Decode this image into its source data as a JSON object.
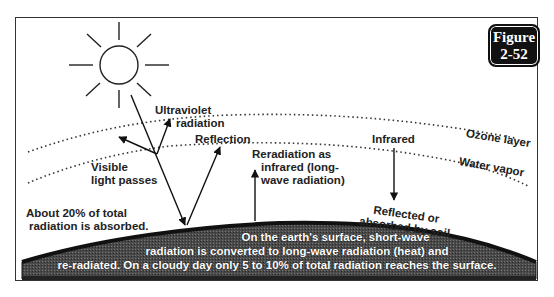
{
  "figure": {
    "badge_line1": "Figure",
    "badge_line2": "2-52"
  },
  "labels": {
    "ultraviolet_line1": "Ultraviolet",
    "ultraviolet_line2": "radiation",
    "reflection": "Reflection",
    "visible_line1": "Visible",
    "visible_line2": "light passes",
    "reradiation_line1": "Reradiation as",
    "reradiation_line2": "infrared (long-",
    "reradiation_line3": "wave radiation)",
    "infrared": "Infrared",
    "ozone_layer": "Ozone layer",
    "water_vapor": "Water vapor",
    "reflected_line1": "Reflected or",
    "reflected_line2": "absorbed by soil",
    "absorbed_line1": "About 20% of total",
    "absorbed_line2": "radiation is absorbed."
  },
  "surface_text": {
    "line1": "On the earth's surface, short-wave",
    "line2": "radiation is converted to long-wave radiation (heat) and",
    "line3": "re-radiated.  On a cloudy day only 5 to 10% of total radiation reaches the surface."
  },
  "colors": {
    "ink": "#222222",
    "earth": "#3a3a3a",
    "badge_bg": "#111111",
    "background": "#ffffff"
  }
}
